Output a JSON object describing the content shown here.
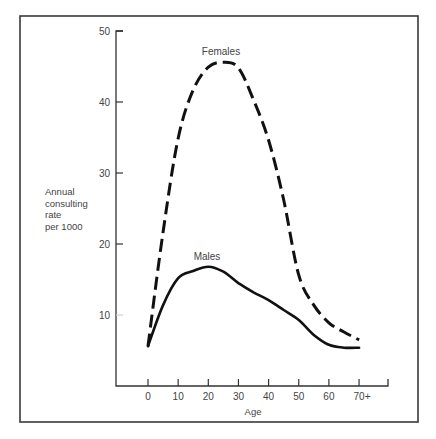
{
  "chart_data": {
    "type": "line",
    "title": "",
    "xlabel": "Age",
    "ylabel": "Annual consulting rate per 1000",
    "ylabel_lines": [
      "Annual",
      "consulting",
      "rate",
      "per 1000"
    ],
    "x_tick_labels": [
      "0",
      "10",
      "20",
      "30",
      "40",
      "50",
      "60",
      "70+"
    ],
    "y_tick_labels": [
      "10",
      "20",
      "30",
      "40",
      "50"
    ],
    "ylim": [
      0,
      50
    ],
    "grid": false,
    "legend": "inline labels",
    "x": [
      0,
      5,
      10,
      15,
      20,
      25,
      30,
      35,
      40,
      45,
      50,
      55,
      60,
      65,
      70
    ],
    "series": [
      {
        "name": "Females",
        "style": "dashed",
        "values": [
          5.6,
          21.7,
          34.9,
          41.7,
          44.9,
          45.6,
          44.8,
          40.3,
          34.6,
          26.2,
          15.6,
          11.4,
          8.9,
          7.6,
          6.5
        ]
      },
      {
        "name": "Males",
        "style": "solid",
        "values": [
          5.6,
          11.4,
          15.2,
          16.2,
          16.8,
          16.1,
          14.5,
          13.2,
          12.1,
          10.7,
          9.3,
          7.2,
          5.8,
          5.4,
          5.4
        ]
      }
    ]
  },
  "labels": {
    "females": "Females",
    "males": "Males",
    "x_axis_title": "Age"
  }
}
